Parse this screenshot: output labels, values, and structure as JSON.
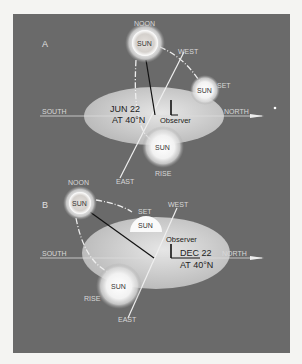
{
  "diagram": {
    "panels": [
      {
        "letter": "A",
        "date": "JUN 22",
        "latitude": "AT 40°N",
        "observer": "Observer",
        "labels": {
          "noon": "NOON",
          "west": "WEST",
          "set": "SET",
          "south": "SOUTH",
          "north": "NORTH",
          "east": "EAST",
          "rise": "RISE"
        },
        "sun": "SUN"
      },
      {
        "letter": "B",
        "date": "DEC 22",
        "latitude": "AT 40°N",
        "observer": "Observer",
        "labels": {
          "noon": "NOON",
          "west": "WEST",
          "set": "SET",
          "south": "SOUTH",
          "north": "NORTH",
          "east": "EAST",
          "rise": "RISE"
        },
        "sun": "SUN"
      }
    ],
    "colors": {
      "background": "#6a6a6a",
      "page": "#f4f4f2",
      "horizon": "#c8c8c8",
      "sun": "#ffffff"
    }
  }
}
